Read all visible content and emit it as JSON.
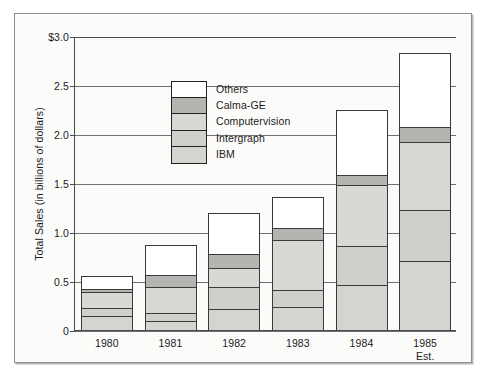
{
  "chart_data": {
    "type": "bar",
    "subtype": "stacked-bar",
    "title": "",
    "xlabel": "",
    "ylabel": "Total Sales (in billions of dollars)",
    "categories": [
      "1980",
      "1981",
      "1982",
      "1983",
      "1984",
      "1985\nEst."
    ],
    "category_labels": [
      {
        "line1": "1980",
        "line2": ""
      },
      {
        "line1": "1981",
        "line2": ""
      },
      {
        "line1": "1982",
        "line2": ""
      },
      {
        "line1": "1983",
        "line2": ""
      },
      {
        "line1": "1984",
        "line2": ""
      },
      {
        "line1": "1985",
        "line2": "Est."
      }
    ],
    "ylim": [
      0,
      3.0
    ],
    "ytick_values": [
      3.0,
      2.5,
      2.0,
      1.5,
      1.0,
      0.5,
      0
    ],
    "ytick_labels": [
      "$3.0",
      "2.5",
      "2.0",
      "1.5",
      "1.0",
      "0.5",
      "0"
    ],
    "grid": true,
    "grid_axis": "y",
    "legend_position": "inside-upper-left",
    "stack_order_bottom_to_top": [
      "IBM",
      "Intergraph",
      "Computervision",
      "Calma-GE",
      "Others"
    ],
    "series": [
      {
        "name": "IBM",
        "color": "#d4d4d0",
        "values": [
          0.14,
          0.08,
          0.21,
          0.23,
          0.45,
          0.7
        ]
      },
      {
        "name": "Intergraph",
        "color": "#cfcfcb",
        "values": [
          0.08,
          0.09,
          0.22,
          0.17,
          0.4,
          0.52
        ]
      },
      {
        "name": "Computervision",
        "color": "#d8d8d4",
        "values": [
          0.16,
          0.26,
          0.2,
          0.52,
          0.63,
          0.7
        ]
      },
      {
        "name": "Calma-GE",
        "color": "#b4b4b0",
        "values": [
          0.04,
          0.13,
          0.14,
          0.12,
          0.1,
          0.15
        ]
      },
      {
        "name": "Others",
        "color": "#ffffff",
        "values": [
          0.13,
          0.31,
          0.42,
          0.32,
          0.67,
          0.76
        ]
      }
    ],
    "totals": [
      0.55,
      0.87,
      1.19,
      1.36,
      2.25,
      2.83
    ]
  },
  "legend": {
    "entries": [
      {
        "label": "Others",
        "color": "#ffffff"
      },
      {
        "label": "Calma-GE",
        "color": "#b4b4b0"
      },
      {
        "label": "Computervision",
        "color": "#d8d8d4"
      },
      {
        "label": "Intergraph",
        "color": "#cfcfcb"
      },
      {
        "label": "IBM",
        "color": "#d4d4d0"
      }
    ]
  },
  "colors": {
    "frame_border": "#8d8d8d",
    "axis": "#4a4a4a",
    "gridline": "#6f6f6f",
    "bar_outline": "#3a3a3a",
    "background": "#fbfbfa",
    "text": "#1b1b1b"
  }
}
